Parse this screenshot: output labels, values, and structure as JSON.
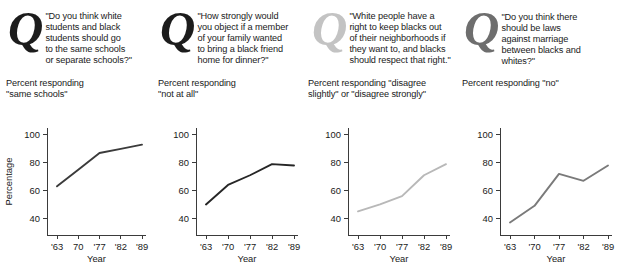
{
  "figure": {
    "width": 618,
    "height": 275,
    "background": "#ffffff"
  },
  "panels": [
    {
      "id": "panel-schools",
      "drop_cap": "Q",
      "drop_cap_color": "#1c1c1c",
      "question": "\"Do you think white\nstudents and black\nstudents should go\nto the same schools\nor separate schools?\"",
      "subtitle": "Percent responding\n \"same schools\"",
      "y_axis_title": "Percentage",
      "x_axis_title": "Year",
      "line_color": "#3b3b3b"
    },
    {
      "id": "panel-dinner",
      "drop_cap": "Q",
      "drop_cap_color": "#1c1c1c",
      "question": "\"How strongly would\nyou object if a member\nof your family wanted\nto bring a black friend\nhome for dinner?\"",
      "subtitle": "Percent responding\n \"not at all\"",
      "y_axis_title": "",
      "x_axis_title": "Year",
      "line_color": "#262626"
    },
    {
      "id": "panel-neighborhoods",
      "drop_cap": "Q",
      "drop_cap_color": "#c3c3c3",
      "question": "\"White people have a\nright to keep blacks out\nof their neighborhoods if\nthey want to, and blacks\nshould respect that right.\"",
      "subtitle": "Percent responding \"disagree\nslightly\" or \"disagree strongly\"",
      "y_axis_title": "",
      "x_axis_title": "Year",
      "line_color": "#b8b8b8"
    },
    {
      "id": "panel-marriage",
      "drop_cap": "Q",
      "drop_cap_color": "#6e6e6e",
      "question": "\"Do you think there\nshould be laws\nagainst marriage\n between blacks and\nwhites?\"",
      "subtitle": "Percent responding \"no\"",
      "y_axis_title": "",
      "x_axis_title": "Year",
      "line_color": "#7a7a7a"
    }
  ],
  "chart_data": [
    {
      "type": "line",
      "title": "Percent responding \"same schools\"",
      "xlabel": "Year",
      "ylabel": "Percentage",
      "categories": [
        "'63",
        "70",
        "'77",
        "'82",
        "'89"
      ],
      "x": [
        1963,
        1970,
        1977,
        1982,
        1989
      ],
      "values": [
        63,
        75,
        87,
        90,
        93
      ],
      "ylim": [
        28,
        105
      ],
      "yticks": [
        40,
        60,
        80,
        100
      ],
      "grid": false,
      "legend": "none",
      "series_color": "#3b3b3b"
    },
    {
      "type": "line",
      "title": "Percent responding \"not at all\"",
      "xlabel": "Year",
      "ylabel": "",
      "categories": [
        "'63",
        "'70",
        "'77",
        "'82",
        "'89"
      ],
      "x": [
        1963,
        1970,
        1977,
        1982,
        1989
      ],
      "values": [
        50,
        64,
        71,
        79,
        78
      ],
      "ylim": [
        28,
        105
      ],
      "yticks": [
        40,
        60,
        80,
        100
      ],
      "grid": false,
      "legend": "none",
      "series_color": "#262626"
    },
    {
      "type": "line",
      "title": "Percent responding \"disagree slightly\" or \"disagree strongly\"",
      "xlabel": "Year",
      "ylabel": "",
      "categories": [
        "'63",
        "'70",
        "'77",
        "'82",
        "'89"
      ],
      "x": [
        1963,
        1970,
        1977,
        1982,
        1989
      ],
      "values": [
        45,
        50,
        56,
        71,
        79
      ],
      "ylim": [
        28,
        105
      ],
      "yticks": [
        40,
        60,
        80,
        100
      ],
      "grid": false,
      "legend": "none",
      "series_color": "#b8b8b8"
    },
    {
      "type": "line",
      "title": "Percent responding \"no\"",
      "xlabel": "Year",
      "ylabel": "",
      "categories": [
        "'63",
        "'70",
        "'77",
        "'82",
        "'89"
      ],
      "x": [
        1963,
        1970,
        1977,
        1982,
        1989
      ],
      "values": [
        37,
        49,
        72,
        67,
        78
      ],
      "ylim": [
        28,
        105
      ],
      "yticks": [
        40,
        60,
        80,
        100
      ],
      "grid": false,
      "legend": "none",
      "series_color": "#7a7a7a"
    }
  ]
}
